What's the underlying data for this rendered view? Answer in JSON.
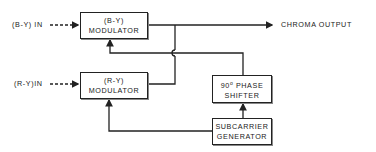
{
  "diagram": {
    "title": "",
    "inputs": {
      "by_in": "(B-Y) IN",
      "ry_in": "(R-Y)IN"
    },
    "blocks": {
      "by_modulator": {
        "line1": "(B-Y)",
        "line2": "MODULATOR"
      },
      "ry_modulator": {
        "line1": "(R-Y)",
        "line2": "MODULATOR"
      },
      "phase_shifter": {
        "line1_num": "90",
        "line1_deg": "o",
        "line1_rest": " PHASE",
        "line2": "SHIFTER"
      },
      "subcarrier_generator": {
        "line1": "SUBCARRIER",
        "line2": "GENERATOR"
      }
    },
    "output": {
      "label": "CHROMA OUTPUT"
    },
    "connections": [
      {
        "from": "(B-Y) IN",
        "to": "(B-Y) MODULATOR",
        "style": "dashed-arrow"
      },
      {
        "from": "(R-Y) IN",
        "to": "(R-Y) MODULATOR",
        "style": "dashed-arrow"
      },
      {
        "from": "(B-Y) MODULATOR",
        "to": "CHROMA OUTPUT",
        "style": "arrow"
      },
      {
        "from": "(R-Y) MODULATOR",
        "to": "CHROMA OUTPUT",
        "style": "line-join"
      },
      {
        "from": "SUBCARRIER GENERATOR",
        "to": "90 PHASE SHIFTER",
        "style": "arrow"
      },
      {
        "from": "SUBCARRIER GENERATOR",
        "to": "(R-Y) MODULATOR",
        "style": "arrow"
      },
      {
        "from": "90 PHASE SHIFTER",
        "to": "(B-Y) MODULATOR",
        "style": "arrow-crossover"
      }
    ],
    "colors": {
      "line": "#222222",
      "background": "#ffffff"
    }
  }
}
